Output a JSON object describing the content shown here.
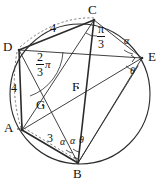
{
  "figure": {
    "stroke_color": "#2b2b2b",
    "label_color": "#111111",
    "background": "#ffffff",
    "circle": {
      "cx": 80,
      "cy": 94,
      "r": 70
    },
    "vertices": [
      {
        "name": "A",
        "label": "A",
        "x": 22,
        "y": 130,
        "lx": 7,
        "ly": 130
      },
      {
        "name": "B",
        "label": "B",
        "x": 78,
        "y": 163,
        "lx": 73,
        "ly": 176
      },
      {
        "name": "C",
        "label": "C",
        "x": 94,
        "y": 20,
        "lx": 90,
        "ly": 10
      },
      {
        "name": "D",
        "label": "D",
        "x": 19,
        "y": 50,
        "lx": 5,
        "ly": 50
      },
      {
        "name": "E",
        "label": "E",
        "x": 142,
        "y": 58,
        "lx": 150,
        "ly": 60
      },
      {
        "name": "F",
        "label": "F",
        "x": 78,
        "y": 88,
        "lx": 73,
        "ly": 85
      },
      {
        "name": "G",
        "label": "G",
        "x": 43,
        "y": 105,
        "lx": 38,
        "ly": 106
      }
    ],
    "lengths": [
      {
        "name": "side-dc",
        "text": "4",
        "x": 52,
        "y": 28
      },
      {
        "name": "side-da",
        "text": "4",
        "x": 14,
        "y": 88
      },
      {
        "name": "side-ab",
        "text": "3",
        "x": 49,
        "y": 138
      }
    ],
    "angles": [
      {
        "name": "angle-at-c",
        "num": "π",
        "den": "3",
        "x": 100,
        "y": 30
      },
      {
        "name": "angle-at-d",
        "num": "2",
        "den": "3",
        "sym": "π",
        "x": 41,
        "y": 59
      },
      {
        "name": "angle-alpha-e",
        "text": "α",
        "x": 125,
        "y": 42
      },
      {
        "name": "angle-theta-e",
        "text": "θ",
        "x": 131,
        "y": 71
      },
      {
        "name": "angle-alpha-b-1",
        "text": "α",
        "x": 62,
        "y": 141
      },
      {
        "name": "angle-alpha-b-2",
        "text": "α",
        "x": 72,
        "y": 139
      },
      {
        "name": "angle-theta-b",
        "text": "θ",
        "x": 81,
        "y": 138
      }
    ]
  }
}
